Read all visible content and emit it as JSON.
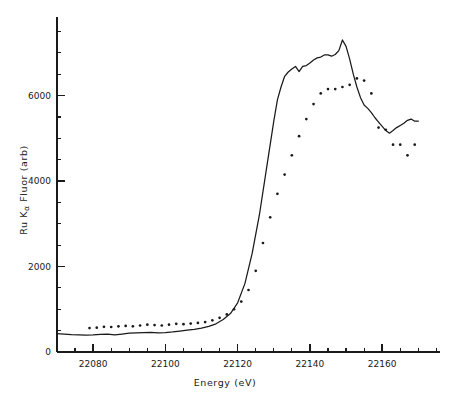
{
  "chart_data": {
    "type": "line",
    "title": "",
    "xlabel": "Energy (eV)",
    "ylabel": "Ru Kα Fluor (arb)",
    "ylabel_parts": {
      "prefix": "Ru K",
      "subscript": "α",
      "suffix": " Fluor (arb)"
    },
    "xlim": [
      22070,
      22176
    ],
    "ylim": [
      0,
      7650
    ],
    "grid": false,
    "legend": null,
    "x_major_ticks": [
      22080,
      22100,
      22120,
      22140,
      22160
    ],
    "x_major_tick_labels": [
      "22080",
      "22100",
      "22120",
      "22140",
      "22160"
    ],
    "x_minor_tick_step": 5,
    "y_major_ticks": [
      0,
      2000,
      4000,
      6000
    ],
    "y_major_tick_labels": [
      "0",
      "2000",
      "4000",
      "6000"
    ],
    "y_minor_tick_step": 500,
    "series": [
      {
        "name": "solid-line",
        "style": "line",
        "color": "#1a1a1a",
        "x": [
          22070,
          22072,
          22074,
          22076,
          22078,
          22080,
          22082,
          22084,
          22086,
          22088,
          22090,
          22092,
          22094,
          22096,
          22098,
          22100,
          22102,
          22104,
          22106,
          22108,
          22110,
          22112,
          22114,
          22116,
          22118,
          22120,
          22122,
          22124,
          22126,
          22128,
          22130,
          22131,
          22132,
          22133,
          22134,
          22135,
          22136,
          22137,
          22138,
          22139,
          22140,
          22141,
          22142,
          22143,
          22144,
          22145,
          22146,
          22147,
          22148,
          22149,
          22150,
          22151,
          22152,
          22153,
          22154,
          22155,
          22156,
          22157,
          22158,
          22159,
          22160,
          22161,
          22162,
          22163,
          22164,
          22165,
          22166,
          22167,
          22168,
          22169,
          22170
        ],
        "y": [
          430,
          420,
          405,
          400,
          395,
          400,
          415,
          420,
          400,
          420,
          440,
          450,
          455,
          460,
          450,
          455,
          470,
          490,
          510,
          530,
          560,
          600,
          660,
          760,
          900,
          1150,
          1600,
          2300,
          3200,
          4300,
          5400,
          5900,
          6200,
          6450,
          6550,
          6620,
          6680,
          6560,
          6680,
          6700,
          6760,
          6830,
          6880,
          6900,
          6950,
          6950,
          6920,
          6960,
          7050,
          7300,
          7150,
          6850,
          6500,
          6200,
          5950,
          5780,
          5700,
          5600,
          5480,
          5380,
          5280,
          5180,
          5120,
          5180,
          5250,
          5300,
          5350,
          5420,
          5450,
          5400,
          5400
        ]
      },
      {
        "name": "dotted-series",
        "style": "dots",
        "color": "#1a1a1a",
        "x": [
          22079,
          22081,
          22083,
          22085,
          22087,
          22089,
          22091,
          22093,
          22095,
          22097,
          22099,
          22101,
          22103,
          22105,
          22107,
          22109,
          22111,
          22113,
          22115,
          22117,
          22119,
          22121,
          22123,
          22125,
          22127,
          22129,
          22131,
          22133,
          22135,
          22137,
          22139,
          22141,
          22143,
          22145,
          22147,
          22149,
          22151,
          22153,
          22155,
          22157,
          22159,
          22161,
          22163,
          22165,
          22167,
          22169
        ],
        "y": [
          560,
          570,
          590,
          585,
          600,
          610,
          600,
          620,
          640,
          630,
          620,
          640,
          660,
          650,
          665,
          680,
          700,
          740,
          800,
          880,
          1000,
          1180,
          1450,
          1900,
          2550,
          3150,
          3700,
          4150,
          4600,
          5050,
          5450,
          5800,
          6050,
          6150,
          6150,
          6200,
          6250,
          6400,
          6350,
          6050,
          5250,
          5200,
          4850,
          4850,
          4600,
          4850
        ]
      }
    ]
  },
  "axis": {
    "x_axis_name": "x-axis",
    "y_axis_name": "y-axis"
  }
}
